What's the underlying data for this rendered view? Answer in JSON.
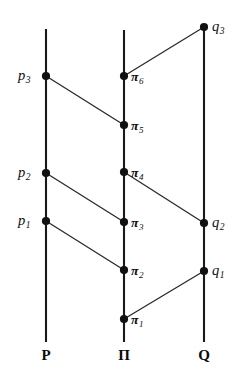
{
  "figure": {
    "type": "diagram",
    "background_color": "#ffffff",
    "line_color": "#1a1a1a",
    "connector_color": "#2b2b2b",
    "dot_color": "#111111",
    "width": 246,
    "height": 381
  },
  "axes": [
    {
      "id": "P",
      "label": "P",
      "x": 46,
      "y_top": 29,
      "y_bottom": 342,
      "label_x": 46,
      "label_y": 348
    },
    {
      "id": "PI",
      "label": "Π",
      "x": 124,
      "y_top": 30,
      "y_bottom": 342,
      "label_x": 124,
      "label_y": 348
    },
    {
      "id": "Q",
      "label": "Q",
      "x": 204,
      "y_top": 27,
      "y_bottom": 342,
      "label_x": 204,
      "label_y": 348
    }
  ],
  "nodes": [
    {
      "id": "p3",
      "axis": "P",
      "base": "p",
      "sub": "3",
      "x": 46,
      "y": 76,
      "label_x": 18,
      "label_y": 68,
      "label_side": "left",
      "style": "italic"
    },
    {
      "id": "p2",
      "axis": "P",
      "base": "p",
      "sub": "2",
      "x": 46,
      "y": 173,
      "label_x": 18,
      "label_y": 165,
      "label_side": "left",
      "style": "italic"
    },
    {
      "id": "p1",
      "axis": "P",
      "base": "p",
      "sub": "1",
      "x": 46,
      "y": 221,
      "label_x": 18,
      "label_y": 213,
      "label_side": "left",
      "style": "italic"
    },
    {
      "id": "pi6",
      "axis": "PI",
      "base": "π",
      "sub": "6",
      "x": 124,
      "y": 76,
      "label_x": 131,
      "label_y": 70,
      "label_side": "right",
      "style": "bold-italic"
    },
    {
      "id": "pi5",
      "axis": "PI",
      "base": "π",
      "sub": "5",
      "x": 124,
      "y": 125,
      "label_x": 131,
      "label_y": 119,
      "label_side": "right",
      "style": "bold-italic"
    },
    {
      "id": "pi4",
      "axis": "PI",
      "base": "π",
      "sub": "4",
      "x": 124,
      "y": 172,
      "label_x": 131,
      "label_y": 166,
      "label_side": "right",
      "style": "bold-italic"
    },
    {
      "id": "pi3",
      "axis": "PI",
      "base": "π",
      "sub": "3",
      "x": 124,
      "y": 222,
      "label_x": 131,
      "label_y": 216,
      "label_side": "right",
      "style": "bold-italic"
    },
    {
      "id": "pi2",
      "axis": "PI",
      "base": "π",
      "sub": "2",
      "x": 124,
      "y": 270,
      "label_x": 131,
      "label_y": 264,
      "label_side": "right",
      "style": "bold-italic"
    },
    {
      "id": "pi1",
      "axis": "PI",
      "base": "π",
      "sub": "1",
      "x": 124,
      "y": 319,
      "label_x": 131,
      "label_y": 313,
      "label_side": "right",
      "style": "bold-italic"
    },
    {
      "id": "q3",
      "axis": "Q",
      "base": "q",
      "sub": "3",
      "x": 204,
      "y": 27,
      "label_x": 212,
      "label_y": 19,
      "label_side": "right",
      "style": "italic"
    },
    {
      "id": "q2",
      "axis": "Q",
      "base": "q",
      "sub": "2",
      "x": 204,
      "y": 223,
      "label_x": 212,
      "label_y": 215,
      "label_side": "right",
      "style": "italic"
    },
    {
      "id": "q1",
      "axis": "Q",
      "base": "q",
      "sub": "1",
      "x": 204,
      "y": 271,
      "label_x": 212,
      "label_y": 263,
      "label_side": "right",
      "style": "italic"
    }
  ],
  "connectors": [
    {
      "id": "p3-pi5",
      "from": "p3",
      "to": "pi5",
      "x1": 46,
      "y1": 76,
      "x2": 124,
      "y2": 125
    },
    {
      "id": "p2-pi3",
      "from": "p2",
      "to": "pi3",
      "x1": 46,
      "y1": 173,
      "x2": 124,
      "y2": 222
    },
    {
      "id": "p1-pi2",
      "from": "p1",
      "to": "pi2",
      "x1": 46,
      "y1": 221,
      "x2": 124,
      "y2": 270
    },
    {
      "id": "pi6-q3",
      "from": "pi6",
      "to": "q3",
      "x1": 124,
      "y1": 76,
      "x2": 204,
      "y2": 27
    },
    {
      "id": "pi4-q2",
      "from": "pi4",
      "to": "q2",
      "x1": 124,
      "y1": 172,
      "x2": 204,
      "y2": 223
    },
    {
      "id": "pi1-q1",
      "from": "pi1",
      "to": "q1",
      "x1": 124,
      "y1": 319,
      "x2": 204,
      "y2": 271
    }
  ],
  "dot_radius": 4.1
}
